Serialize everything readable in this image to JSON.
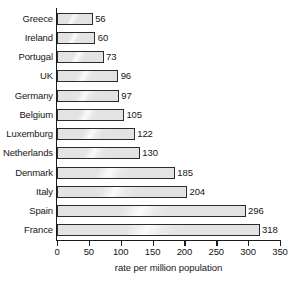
{
  "chart_data": {
    "type": "bar",
    "orientation": "horizontal",
    "title": "",
    "xlabel": "rate per million population",
    "ylabel": "",
    "xlim": [
      0,
      350
    ],
    "xticks": [
      0,
      50,
      100,
      150,
      200,
      250,
      300,
      350
    ],
    "grid": false,
    "legend": null,
    "categories": [
      "Greece",
      "Ireland",
      "Portugal",
      "UK",
      "Germany",
      "Belgium",
      "Luxemburg",
      "Netherlands",
      "Denmark",
      "Italy",
      "Spain",
      "France"
    ],
    "values": [
      56,
      60,
      73,
      96,
      97,
      105,
      122,
      130,
      185,
      204,
      296,
      318
    ],
    "data_labels": [
      "56",
      "60",
      "73",
      "96",
      "97",
      "105",
      "122",
      "130",
      "185",
      "204",
      "296",
      "318"
    ],
    "colors": {
      "bar_fill": "#e3e3e3",
      "bar_border": "#2b2b2b",
      "axis": "#1a1a1a",
      "text": "#161616",
      "background": "#ffffff"
    }
  }
}
